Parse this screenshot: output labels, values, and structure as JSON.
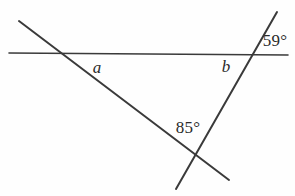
{
  "figure": {
    "type": "geometry-diagram",
    "width": 295,
    "height": 196,
    "background_color": "#fefefe",
    "stroke_color": "#3a3a3a",
    "text_color": "#2b2b2b",
    "lines": [
      {
        "name": "horizontal-line",
        "x1": 9,
        "y1": 53,
        "x2": 288,
        "y2": 55,
        "stroke_width": 1.6
      },
      {
        "name": "diagonal-line",
        "x1": 19,
        "y1": 21,
        "x2": 229,
        "y2": 180,
        "stroke_width": 2.0
      },
      {
        "name": "transversal-line",
        "x1": 277,
        "y1": 12,
        "x2": 176,
        "y2": 189,
        "stroke_width": 2.0
      }
    ],
    "intersections": [
      {
        "name": "left-vertex",
        "x": 63,
        "y": 53
      },
      {
        "name": "right-vertex",
        "x": 248,
        "y": 54
      },
      {
        "name": "bottom-vertex",
        "x": 193,
        "y": 156
      }
    ],
    "labels": [
      {
        "name": "angle-label-a",
        "text": "a",
        "x": 97,
        "y": 67,
        "style": "var"
      },
      {
        "name": "angle-label-b",
        "text": "b",
        "x": 226,
        "y": 66,
        "style": "var"
      },
      {
        "name": "angle-label-59",
        "text": "59°",
        "x": 275,
        "y": 40,
        "style": "angle"
      },
      {
        "name": "angle-label-85",
        "text": "85°",
        "x": 188,
        "y": 127,
        "style": "angle"
      }
    ]
  }
}
